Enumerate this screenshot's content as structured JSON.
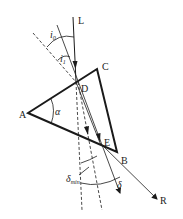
{
  "diagram": {
    "labels": {
      "L": "L",
      "C": "C",
      "D": "D",
      "A": "A",
      "E": "E",
      "B": "B",
      "R": "R",
      "i0": "i",
      "i0_sub": "0",
      "i1": "i",
      "i1_sub": "1",
      "alpha": "α",
      "delta": "δ",
      "delta_min": "δ",
      "delta_min_sub": "min"
    },
    "colors": {
      "line": "#1a1a1a",
      "background": "#ffffff"
    }
  }
}
